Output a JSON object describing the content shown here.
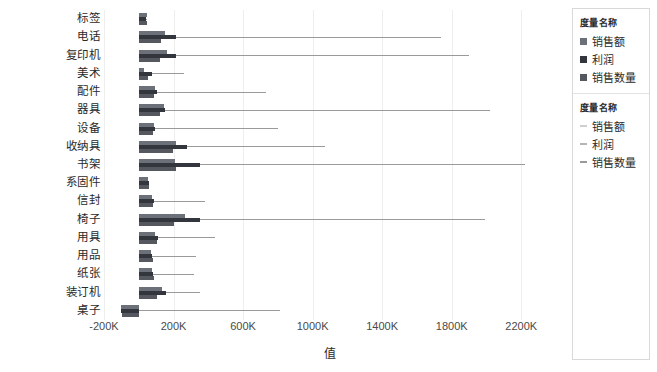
{
  "axis": {
    "x_title": "值",
    "x_ticks": [
      "-200K",
      "200K",
      "600K",
      "1000K",
      "1400K",
      "1800K",
      "2200K"
    ]
  },
  "legend": {
    "blocks": [
      {
        "title": "度量名称",
        "marker_style": "square",
        "items": [
          {
            "label": "销售额",
            "color": "#6b7079"
          },
          {
            "label": "利润",
            "color": "#33373d"
          },
          {
            "label": "销售数量",
            "color": "#55595f"
          }
        ]
      },
      {
        "title": "度量名称",
        "marker_style": "line",
        "items": [
          {
            "label": "销售额",
            "color": "#cfcfcf"
          },
          {
            "label": "利润",
            "color": "#b5b5b5"
          },
          {
            "label": "销售数量",
            "color": "#9a9a9a"
          }
        ]
      }
    ]
  },
  "chart_data": {
    "type": "bar",
    "orientation": "horizontal",
    "title": "",
    "xlabel": "值",
    "ylabel": "",
    "xlim": [
      -200000,
      2400000
    ],
    "grid": true,
    "legend_position": "right",
    "categories": [
      "标签",
      "电话",
      "复印机",
      "美术",
      "配件",
      "器具",
      "设备",
      "收纳具",
      "书架",
      "系固件",
      "信封",
      "椅子",
      "用具",
      "用品",
      "纸张",
      "装订机",
      "桌子"
    ],
    "series": [
      {
        "name": "销售额",
        "color": "#6b7079",
        "values": [
          45000,
          150000,
          160000,
          30000,
          95000,
          145000,
          85000,
          215000,
          210000,
          55000,
          75000,
          265000,
          95000,
          70000,
          75000,
          135000,
          -105000
        ]
      },
      {
        "name": "利润",
        "color": "#33373d",
        "values": [
          40000,
          215000,
          215000,
          75000,
          105000,
          150000,
          95000,
          275000,
          355000,
          60000,
          85000,
          350000,
          110000,
          75000,
          80000,
          155000,
          -100000
        ]
      },
      {
        "name": "销售数量",
        "color": "#55595f",
        "values": [
          50000,
          130000,
          125000,
          55000,
          90000,
          120000,
          80000,
          195000,
          215000,
          60000,
          80000,
          200000,
          105000,
          80000,
          85000,
          105000,
          -95000
        ]
      }
    ],
    "reference_lines": [
      {
        "category": "标签",
        "value": 50000
      },
      {
        "category": "电话",
        "value": 1740000
      },
      {
        "category": "复印机",
        "value": 1900000
      },
      {
        "category": "美术",
        "value": 260000
      },
      {
        "category": "配件",
        "value": 730000
      },
      {
        "category": "器具",
        "value": 2020000
      },
      {
        "category": "设备",
        "value": 800000
      },
      {
        "category": "收纳具",
        "value": 1070000
      },
      {
        "category": "书架",
        "value": 2220000
      },
      {
        "category": "系固件",
        "value": 60000
      },
      {
        "category": "信封",
        "value": 380000
      },
      {
        "category": "椅子",
        "value": 1990000
      },
      {
        "category": "用具",
        "value": 440000
      },
      {
        "category": "用品",
        "value": 330000
      },
      {
        "category": "纸张",
        "value": 320000
      },
      {
        "category": "装订机",
        "value": 355000
      },
      {
        "category": "桌子",
        "value": 810000
      }
    ]
  }
}
